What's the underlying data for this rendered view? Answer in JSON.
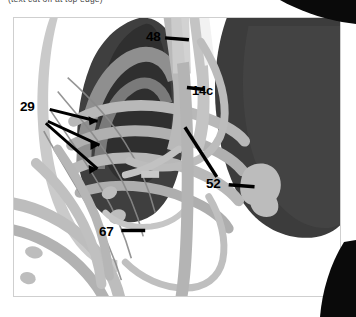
{
  "caption": {
    "text": "(text cut off at top edge)"
  },
  "figure": {
    "frame": {
      "border_color": "#cfcfcf",
      "background": "#ffffff"
    },
    "labels": [
      {
        "id": "48",
        "text": "48",
        "leader": "line pointing right from label to central vertical band (trachea / mediastinal structure)"
      },
      {
        "id": "29",
        "text": "29",
        "leader": "three lines fanning right to arrowheads on posterior rib arcs"
      },
      {
        "id": "14c",
        "text": "14c",
        "leader": "short line pointing left from label to central vascular band"
      },
      {
        "id": "52",
        "text": "52",
        "leader": "line pointing right from label to light-gray hilar blob inside right lung; second line runs up-left"
      },
      {
        "id": "67",
        "text": "67",
        "leader": "line pointing right from label to vertical light-gray band"
      }
    ],
    "colors": {
      "lung_dark": "#3c3c3c",
      "lung_mid": "#6f6f6f",
      "rib_light": "#b5b5b5",
      "rib_mid": "#9a9a9a",
      "soft_tissue": "#c9c9c9",
      "blob": "#b9b9b9",
      "background": "#ffffff",
      "corner_black": "#0a0a0a",
      "leader_line": "#000000"
    },
    "structures": [
      {
        "name": "left-lung-field",
        "tone": "dark gray mass, upper-left"
      },
      {
        "name": "right-lung-field",
        "tone": "large dark gray mass, right half"
      },
      {
        "name": "rib-arcs",
        "tone": "light gray bands arcing across left hemithorax"
      },
      {
        "name": "mediastinal-bands",
        "tone": "light gray vertical bands at center"
      },
      {
        "name": "hilar-blob",
        "tone": "light gray rounded blob in right lung"
      },
      {
        "name": "diaphragm-arc",
        "tone": "light gray curved arc, lower right"
      }
    ]
  }
}
